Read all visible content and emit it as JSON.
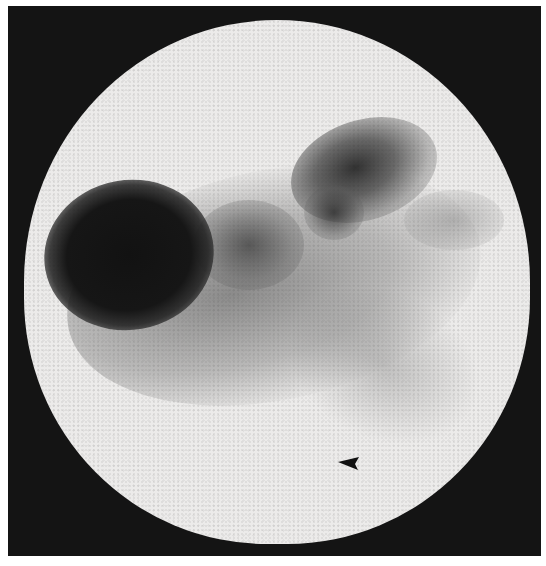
{
  "image": {
    "type": "scintigraphy-scan",
    "background_color": "#141414",
    "field_color": "#ecebea",
    "uptake_color": "#121212"
  },
  "annotations": [
    {
      "kind": "arrowhead",
      "direction": "left",
      "color": "#111111"
    }
  ]
}
